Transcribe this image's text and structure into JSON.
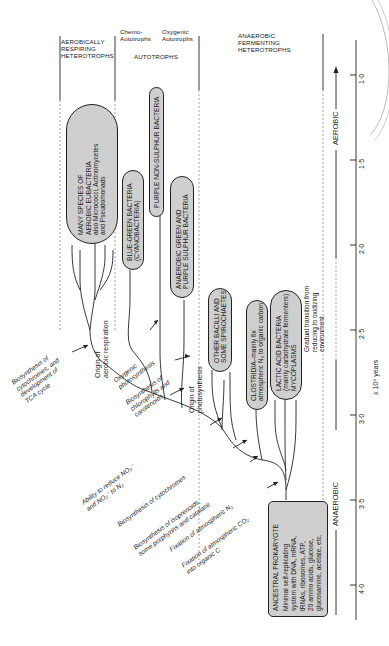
{
  "headers": {
    "aerobic": "AEROBICALLY\nRESPIRING\nHETEROTROPHS",
    "chemo": "Chemo-\nAutotrophs",
    "oxygenic": "Oxygenic\nAutotrophs",
    "autotrophs": "AUTOTROPHS",
    "anaerobic": "ANAEROBIC\nFERMENTING\nHETEROTROPHS"
  },
  "groups": {
    "aerobic_eubacteria": [
      "MANY SPECIES OF",
      "AEROBIC EUBACTERIA",
      "also Micrococci, Actinomycetes",
      "and Pseudomonads"
    ],
    "blue_green": [
      "BLUE-GREEN BACTERIA",
      "(CYANOBACTERIA)"
    ],
    "purple_non_sulphur": [
      "PURPLE NON-SULPHUR BACTERIA"
    ],
    "green_purple_sulphur": [
      "ANAEROBIC GREEN AND",
      "PURPLE SULPHUR BACTERIA"
    ],
    "bacilli": [
      "OTHER BACILLI AND",
      "SOME SPIROCHAETES"
    ],
    "clostridia": [
      "CLOSTRIDIA–mainly fix",
      "atmospheric N₂ to organic carbon"
    ],
    "lactic": [
      "LACTIC ACID BACTERIA",
      "(mainly carbohydrate fermenters)",
      "MYCOPLASMS"
    ],
    "ancestral": [
      "ANCESTRAL PROKARYOTE",
      "Minimal self-replicating",
      "system with DNA, mRNA,",
      "tRNAs, ribosomes, ATP,",
      "20 amino acids, glucose,",
      "glucosamine, acetate, etc."
    ]
  },
  "events": {
    "aerobic_origin": [
      "Origin of",
      "aerobic respiration"
    ],
    "photo_origin": [
      "Origin of",
      "photosynthesis"
    ],
    "oxygenic_photo": [
      "Oxygenic",
      "photosynthesis"
    ],
    "chlorophylls": [
      "Biosynthesis of",
      "chlorophylls and",
      "carotenoids"
    ],
    "cytochromes_tca": [
      "Biosynthesis of",
      "cytochromes, and",
      "development of",
      "TCA cycle"
    ],
    "nitrate": [
      "Ability to reduce NO₃⁻",
      "and NO₂⁻ to N₂"
    ],
    "cytochromes": [
      "Biosynthesis of cytochromes"
    ],
    "isoprenoids": [
      "Biosynthesis of isoprenoids,",
      "some porphyrins and catalase"
    ],
    "n2_fix": [
      "Fixation of atmospheric N₂"
    ],
    "co2_fix": [
      "Fixation of atmospheric CO₂",
      "into organic C"
    ]
  },
  "environment": {
    "aerobic": "AEROBIC",
    "anaerobic": "ANAEROBIC",
    "transition": [
      "Gradual transition from",
      "reducing to oxidizing",
      "environment"
    ]
  },
  "axis": {
    "ticks": [
      "1·0",
      "1·5",
      "2·0",
      "2·5",
      "3·0",
      "3·5",
      "4·0"
    ],
    "unit": "x 10⁹ years"
  }
}
